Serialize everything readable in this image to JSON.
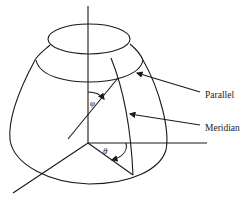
{
  "diagram": {
    "title": "",
    "labels": {
      "parallel": "Parallel",
      "meridian": "Meridian",
      "phi": "φ",
      "theta": "θ"
    },
    "elements": [
      "vertical-axis",
      "horizontal-axis",
      "diagonal-axis",
      "top-parallel-ellipse",
      "parallel-circle",
      "shell-outline",
      "meridian-curve",
      "phi-radius-line",
      "theta-radius-line",
      "phi-angle-arc",
      "theta-angle-arc",
      "parallel-leader-arrow",
      "meridian-leader-arrow"
    ],
    "colors": {
      "line": "#1a1a1a",
      "background": "#ffffff"
    }
  }
}
